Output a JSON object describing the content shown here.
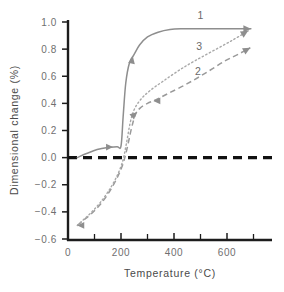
{
  "chart_data": {
    "type": "line",
    "title": "",
    "xlabel": "Temperature (°C)",
    "ylabel": "Dimensional change (%)",
    "xlim": [
      0,
      730
    ],
    "ylim": [
      -0.6,
      1.0
    ],
    "xticks": [
      0,
      100,
      200,
      300,
      400,
      500,
      600,
      700
    ],
    "xtick_labels": [
      "0",
      "",
      "200",
      "",
      "400",
      "",
      "600",
      ""
    ],
    "xtick_labels_major": [
      "0",
      "200",
      "400",
      "600"
    ],
    "yticks": [
      -0.6,
      -0.4,
      -0.2,
      0.0,
      0.2,
      0.4,
      0.6,
      0.8,
      1.0
    ],
    "ytick_labels": [
      "−0.6",
      "−0.4",
      "−0.2",
      "0.0",
      "0.2",
      "0.4",
      "0.6",
      "0.8",
      "1.0"
    ],
    "grid": false,
    "legend": "inline-curve-numbers",
    "reference_line": {
      "name": "zero-line",
      "y": 0.0,
      "style": "dashed",
      "color": "#111111"
    },
    "series": [
      {
        "name": "1",
        "label": "1",
        "style": "solid",
        "color": "#8e8e8e",
        "label_position": {
          "x": 500,
          "y": 1.02
        },
        "arrow_end": true,
        "points": [
          [
            35,
            0.0
          ],
          [
            70,
            0.03
          ],
          [
            110,
            0.06
          ],
          [
            150,
            0.075
          ],
          [
            185,
            0.08
          ],
          [
            200,
            0.085
          ],
          [
            208,
            0.3
          ],
          [
            218,
            0.55
          ],
          [
            232,
            0.7
          ],
          [
            248,
            0.755
          ],
          [
            270,
            0.83
          ],
          [
            300,
            0.89
          ],
          [
            340,
            0.925
          ],
          [
            385,
            0.945
          ],
          [
            430,
            0.95
          ],
          [
            520,
            0.95
          ],
          [
            620,
            0.95
          ],
          [
            690,
            0.95
          ]
        ]
      },
      {
        "name": "2",
        "label": "2",
        "style": "dashed",
        "color": "#9a9a9a",
        "label_position": {
          "x": 490,
          "y": 0.61
        },
        "arrow_end": true,
        "points": [
          [
            35,
            -0.5
          ],
          [
            60,
            -0.46
          ],
          [
            90,
            -0.41
          ],
          [
            120,
            -0.35
          ],
          [
            150,
            -0.27
          ],
          [
            180,
            -0.17
          ],
          [
            205,
            -0.06
          ],
          [
            222,
            0.06
          ],
          [
            240,
            0.22
          ],
          [
            255,
            0.32
          ],
          [
            272,
            0.365
          ],
          [
            300,
            0.4
          ],
          [
            330,
            0.425
          ],
          [
            380,
            0.475
          ],
          [
            450,
            0.545
          ],
          [
            520,
            0.625
          ],
          [
            590,
            0.71
          ],
          [
            650,
            0.77
          ],
          [
            688,
            0.81
          ]
        ]
      },
      {
        "name": "3",
        "label": "3",
        "style": "dotted",
        "color": "#a8a8a8",
        "label_position": {
          "x": 495,
          "y": 0.79
        },
        "arrow_end": true,
        "points": [
          [
            35,
            -0.5
          ],
          [
            60,
            -0.455
          ],
          [
            90,
            -0.4
          ],
          [
            120,
            -0.335
          ],
          [
            150,
            -0.255
          ],
          [
            180,
            -0.155
          ],
          [
            205,
            -0.035
          ],
          [
            220,
            0.1
          ],
          [
            235,
            0.26
          ],
          [
            250,
            0.355
          ],
          [
            275,
            0.43
          ],
          [
            310,
            0.495
          ],
          [
            360,
            0.565
          ],
          [
            420,
            0.645
          ],
          [
            480,
            0.715
          ],
          [
            550,
            0.79
          ],
          [
            620,
            0.865
          ],
          [
            680,
            0.935
          ]
        ]
      }
    ],
    "mid_arrows": [
      {
        "series": "1",
        "x": 170,
        "y": 0.078,
        "dir": "right"
      },
      {
        "series": "1",
        "x": 245,
        "y": 0.745,
        "dir": "up"
      },
      {
        "series": "2",
        "x": 260,
        "y": 0.335,
        "dir": "upright"
      },
      {
        "series": "2",
        "x": 322,
        "y": 0.418,
        "dir": "left"
      },
      {
        "series": "2",
        "x": 35,
        "y": -0.5,
        "dir": "left"
      }
    ]
  }
}
